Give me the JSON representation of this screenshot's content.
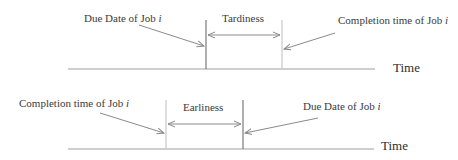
{
  "colors": {
    "background": "#ffffff",
    "axis": "#a0a0a0",
    "due_date_line": "#7a7a7a",
    "completion_line": "#c8c8c8",
    "arrow": "#8a8a8a",
    "text": "#3a3a3a"
  },
  "top_panel": {
    "left_label": {
      "text": "Due Date of Job ",
      "var": "i"
    },
    "span_label": "Tardiness",
    "right_label": {
      "text": "Completion time of Job ",
      "var": "i"
    },
    "axis_label": "Time"
  },
  "bottom_panel": {
    "left_label": {
      "text": "Completion time of Job ",
      "var": "i"
    },
    "span_label": "Earliness",
    "right_label": {
      "text": "Due Date of Job ",
      "var": "i"
    },
    "axis_label": "Time"
  }
}
